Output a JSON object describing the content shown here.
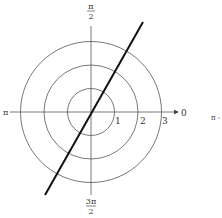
{
  "diagram": {
    "type": "polar-graph",
    "center": {
      "x": 91,
      "y": 112
    },
    "unit_px": 23.5,
    "circles": [
      1,
      2,
      3
    ],
    "line": {
      "description": "straight line through the pole",
      "x1": 45,
      "y1": 195,
      "x2": 143,
      "y2": 22
    },
    "colors": {
      "grid": "#555555",
      "curve": "#111111",
      "text": "#333333"
    }
  },
  "labels": {
    "top": {
      "numerator": "π",
      "denominator": "2"
    },
    "bottom": {
      "numerator": "3π",
      "denominator": "2"
    },
    "left": "π",
    "right": "0",
    "ticks": [
      "1",
      "2",
      "3"
    ],
    "cropped_right": "π -"
  }
}
